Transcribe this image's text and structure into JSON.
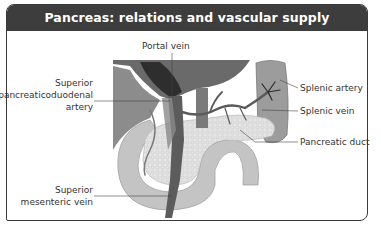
{
  "title": "Pancreas: relations and vascular supply",
  "labels": {
    "portal_vein": "Portal vein",
    "spda_line1": "Superior",
    "spda_line2": "pancreaticoduodenal",
    "spda_line3": "artery",
    "splenic_artery": "Splenic artery",
    "splenic_vein": "Splenic vein",
    "pancreatic_duct": "Pancreatic duct",
    "smv_line1": "Superior",
    "smv_line2": "mesenteric vein"
  },
  "colors": {
    "header_bg": "#3d3d3d",
    "header_text": "#ffffff",
    "liver": "#6e6e6e",
    "stomach": "#8a8a8a",
    "duodenum": "#c2c2c2",
    "pancreas": "#dedede",
    "spleen": "#9a9a9a",
    "vessels": "#5a5a5a"
  }
}
